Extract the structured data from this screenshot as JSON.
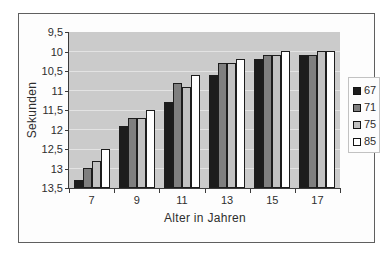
{
  "chart_data": {
    "type": "bar",
    "title": "",
    "xlabel": "Alter in Jahren",
    "ylabel": "Sekunden",
    "categories": [
      "7",
      "9",
      "11",
      "13",
      "15",
      "17"
    ],
    "series": [
      {
        "name": "67",
        "color": "#1c1c1c",
        "values": [
          13.3,
          11.9,
          11.3,
          10.6,
          10.2,
          10.1
        ]
      },
      {
        "name": "71",
        "color": "#7f7f7f",
        "values": [
          13.0,
          11.7,
          10.8,
          10.3,
          10.1,
          10.1
        ]
      },
      {
        "name": "75",
        "color": "#c2c2c2",
        "values": [
          12.8,
          11.7,
          10.9,
          10.3,
          10.1,
          10.0
        ]
      },
      {
        "name": "85",
        "color": "#ffffff",
        "values": [
          12.5,
          11.5,
          10.6,
          10.2,
          10.0,
          10.0
        ]
      }
    ],
    "y_axis": {
      "min": 9.5,
      "max": 13.5,
      "step": 0.5,
      "inverted": true,
      "tick_labels": [
        "9,5",
        "10",
        "10,5",
        "11",
        "11,5",
        "12",
        "12,5",
        "13",
        "13,5"
      ]
    },
    "x_axis": {
      "tick_labels": [
        "7",
        "9",
        "11",
        "13",
        "15",
        "17"
      ]
    },
    "legend": {
      "position": "right",
      "entries": [
        "67",
        "71",
        "75",
        "85"
      ]
    },
    "grid": true,
    "plot_background": "#cbcbcb",
    "bar_outline_color": "#1d1d1d"
  }
}
